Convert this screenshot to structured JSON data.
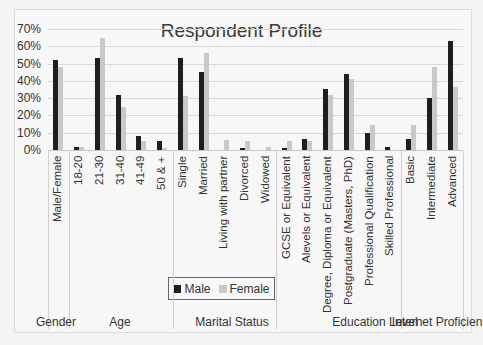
{
  "chart_data": {
    "type": "bar",
    "title": "Respondent Profile",
    "xlabel": "",
    "ylabel": "",
    "ylim": [
      0,
      0.7
    ],
    "y_ticks": [
      "0%",
      "10%",
      "20%",
      "30%",
      "40%",
      "50%",
      "60%",
      "70%"
    ],
    "grid": true,
    "legend_position": "bottom-inside",
    "categories": [
      "Male/Female",
      "18-20",
      "21-30",
      "31-40",
      "41-49",
      "50 & +",
      "Single",
      "Married",
      "Living with partner",
      "Divorced",
      "Widowed",
      "GCSE or Equivalent",
      "Alevels or Equivalent",
      "Degree, Diploma or Equivalent",
      "Postgraduate (Masters, PhD)",
      "Professional Qualification",
      "Skilled Professional",
      "Basic",
      "Intermediate",
      "Advanced"
    ],
    "groups": [
      {
        "name": "Gender",
        "categories": [
          "Male/Female"
        ]
      },
      {
        "name": "Age",
        "categories": [
          "18-20",
          "21-30",
          "31-40",
          "41-49",
          "50 & +"
        ]
      },
      {
        "name": "Marital Status",
        "categories": [
          "Single",
          "Married",
          "Living with partner",
          "Divorced",
          "Widowed"
        ]
      },
      {
        "name": "Education Level",
        "categories": [
          "GCSE or Equivalent",
          "Alevels or Equivalent",
          "Degree, Diploma or Equivalent",
          "Postgraduate (Masters, PhD)",
          "Professional Qualification",
          "Skilled Professional"
        ]
      },
      {
        "name": "Internet Proficien",
        "categories": [
          "Basic",
          "Intermediate",
          "Advanced"
        ]
      }
    ],
    "series": [
      {
        "name": "Male",
        "color": "#1f1f1f",
        "values": [
          0.52,
          0.015,
          0.535,
          0.32,
          0.08,
          0.05,
          0.535,
          0.45,
          0.0,
          0.01,
          0.0,
          0.01,
          0.065,
          0.355,
          0.44,
          0.1,
          0.015,
          0.065,
          0.3,
          0.63
        ]
      },
      {
        "name": "Female",
        "color": "#c9c9c9",
        "values": [
          0.48,
          0.015,
          0.65,
          0.25,
          0.05,
          0.01,
          0.31,
          0.56,
          0.055,
          0.05,
          0.015,
          0.05,
          0.05,
          0.32,
          0.41,
          0.145,
          0.0,
          0.145,
          0.48,
          0.365
        ]
      }
    ]
  },
  "legend": {
    "male": "Male",
    "female": "Female"
  }
}
